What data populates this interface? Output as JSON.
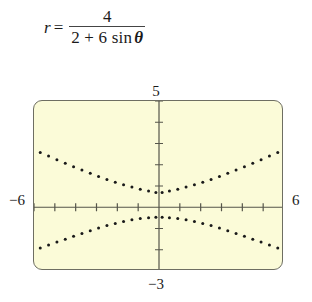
{
  "equation": {
    "lhs": "r",
    "equals": "=",
    "numerator": "4",
    "denominator_prefix": "2 + 6 sin",
    "denominator_variable": "θ",
    "plain": "r = 4 / (2 + 6 sin θ)"
  },
  "viewport": {
    "xmin_label": "−6",
    "xmax_label": "6",
    "ymax_label": "5",
    "ymin_label": "−3",
    "xmin": -6,
    "xmax": 6,
    "ymin": -3,
    "ymax": 5,
    "xscale": 1,
    "yscale": 1,
    "screen_fill": "#fbfbd8",
    "screen_border": "#6e6e62",
    "axis_color": "#55554a",
    "plot_color": "#1a1a1a"
  },
  "chart_data": {
    "type": "scatter",
    "title": "",
    "xlabel": "",
    "ylabel": "",
    "xlim": [
      -6,
      6
    ],
    "ylim": [
      -3,
      5
    ],
    "grid": false,
    "legend": false,
    "equation": "r = 4 / (2 + 6 sin θ)",
    "curve_kind": "hyperbola",
    "eccentricity": 3,
    "directrix": "y = 2/3",
    "render_style": "dotted",
    "series": [
      {
        "name": "upper-branch",
        "description": "Branch opening upward, vertex near (0, 0.66)",
        "x": [
          -5.7,
          -5.3,
          -4.9,
          -4.5,
          -4.1,
          -3.7,
          -3.3,
          -2.9,
          -2.5,
          -2.1,
          -1.7,
          -1.3,
          -0.9,
          -0.5,
          -0.15,
          0.15,
          0.5,
          0.9,
          1.3,
          1.7,
          2.1,
          2.5,
          2.9,
          3.3,
          3.7,
          4.1,
          4.5,
          4.9,
          5.3,
          5.7
        ],
        "y": [
          2.58,
          2.41,
          2.24,
          2.07,
          1.91,
          1.75,
          1.6,
          1.45,
          1.31,
          1.18,
          1.06,
          0.95,
          0.85,
          0.76,
          0.7,
          0.7,
          0.76,
          0.85,
          0.95,
          1.06,
          1.18,
          1.31,
          1.45,
          1.6,
          1.75,
          1.91,
          2.07,
          2.24,
          2.41,
          2.58
        ]
      },
      {
        "name": "lower-branch",
        "description": "Branch opening downward, vertex near (0, -0.5)",
        "x": [
          -5.7,
          -5.3,
          -4.9,
          -4.5,
          -4.1,
          -3.7,
          -3.3,
          -2.9,
          -2.5,
          -2.1,
          -1.7,
          -1.3,
          -0.9,
          -0.5,
          -0.15,
          0.15,
          0.5,
          0.9,
          1.3,
          1.7,
          2.1,
          2.5,
          2.9,
          3.3,
          3.7,
          4.1,
          4.5,
          4.9,
          5.3,
          5.7
        ],
        "y": [
          -1.92,
          -1.78,
          -1.64,
          -1.5,
          -1.36,
          -1.23,
          -1.1,
          -0.98,
          -0.86,
          -0.76,
          -0.67,
          -0.59,
          -0.53,
          -0.49,
          -0.47,
          -0.47,
          -0.49,
          -0.53,
          -0.59,
          -0.67,
          -0.76,
          -0.86,
          -0.98,
          -1.1,
          -1.23,
          -1.36,
          -1.5,
          -1.64,
          -1.78,
          -1.92
        ]
      }
    ]
  }
}
